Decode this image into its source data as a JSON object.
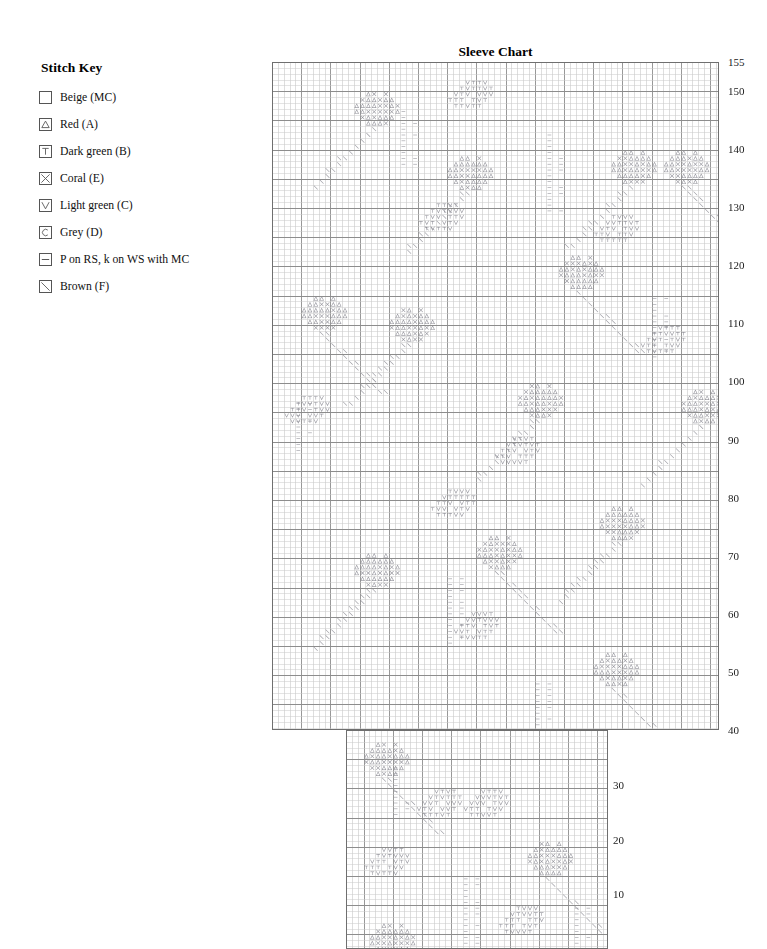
{
  "key": {
    "title": "Stitch Key",
    "items": [
      {
        "symbol": "empty-box",
        "icon": "blank-swatch-icon",
        "label": "Beige (MC)"
      },
      {
        "symbol": "triangle",
        "icon": "triangle-swatch-icon",
        "label": "Red (A)"
      },
      {
        "symbol": "t",
        "icon": "t-swatch-icon",
        "label": "Dark green (B)"
      },
      {
        "symbol": "x",
        "icon": "x-swatch-icon",
        "label": "Coral (E)"
      },
      {
        "symbol": "v",
        "icon": "v-swatch-icon",
        "label": "Light green (C)"
      },
      {
        "symbol": "c",
        "icon": "c-swatch-icon",
        "label": "Grey (D)"
      },
      {
        "symbol": "dash",
        "icon": "dash-swatch-icon",
        "label": "P on RS, k on WS with MC"
      },
      {
        "symbol": "diagonal",
        "icon": "diagonal-swatch-icon",
        "label": "Brown (F)"
      }
    ]
  },
  "chart": {
    "title": "Sleeve Chart",
    "row_labels": [
      "155",
      "150",
      "140",
      "130",
      "120",
      "110",
      "100",
      "90",
      "80",
      "70",
      "60",
      "50",
      "40",
      "30",
      "20",
      "10"
    ],
    "colors": {
      "grid_light": "#c9c9c9",
      "grid_bold": "#8d8d8d",
      "border": "#6f6f6f",
      "symbol": "#8e8e96",
      "text": "#1a1a1a"
    }
  },
  "chart_data": {
    "type": "heatmap",
    "title": "Sleeve Chart",
    "xlabel": "",
    "ylabel": "Row",
    "grid": true,
    "legend_position": "left",
    "cell_px": 5.84,
    "upper_section": {
      "rows": [
        40,
        155
      ],
      "stitches": 76,
      "x": 272,
      "y": 62,
      "width": 447,
      "height": 668
    },
    "lower_section": {
      "rows": [
        1,
        40
      ],
      "stitches": 45,
      "x": 346,
      "y": 730,
      "width": 262,
      "height": 219
    },
    "row_label_ticks": [
      155,
      150,
      140,
      130,
      120,
      110,
      100,
      90,
      80,
      70,
      60,
      50,
      40,
      30,
      20,
      10
    ],
    "symbols_used": [
      "triangle",
      "x",
      "t",
      "v",
      "c",
      "dash",
      "diagonal",
      "blank"
    ],
    "motifs": [
      {
        "type": "flower-head",
        "symbols": [
          "triangle",
          "x"
        ],
        "row": 150,
        "stitch": 14
      },
      {
        "type": "leaf-cluster",
        "symbols": [
          "t",
          "v"
        ],
        "row": 152,
        "stitch": 30
      },
      {
        "type": "flower-head",
        "symbols": [
          "triangle",
          "x"
        ],
        "row": 140,
        "stitch": 58
      },
      {
        "type": "flower-head",
        "symbols": [
          "triangle",
          "x"
        ],
        "row": 140,
        "stitch": 67
      },
      {
        "type": "flower-head",
        "symbols": [
          "triangle",
          "x"
        ],
        "row": 139,
        "stitch": 30
      },
      {
        "type": "leaf-cluster",
        "symbols": [
          "t",
          "v"
        ],
        "row": 131,
        "stitch": 25
      },
      {
        "type": "leaf-cluster",
        "symbols": [
          "t",
          "v"
        ],
        "row": 129,
        "stitch": 55
      },
      {
        "type": "flower-head",
        "symbols": [
          "triangle",
          "x"
        ],
        "row": 122,
        "stitch": 49
      },
      {
        "type": "flower-head",
        "symbols": [
          "triangle",
          "x"
        ],
        "row": 113,
        "stitch": 20
      },
      {
        "type": "flower-head",
        "symbols": [
          "triangle",
          "x"
        ],
        "row": 115,
        "stitch": 5
      },
      {
        "type": "leaf-cluster",
        "symbols": [
          "t",
          "v"
        ],
        "row": 110,
        "stitch": 63
      },
      {
        "type": "flower-head",
        "symbols": [
          "triangle",
          "x"
        ],
        "row": 100,
        "stitch": 42
      },
      {
        "type": "flower-head",
        "symbols": [
          "triangle",
          "x"
        ],
        "row": 99,
        "stitch": 70
      },
      {
        "type": "leaf-cluster",
        "symbols": [
          "t",
          "v"
        ],
        "row": 97,
        "stitch": 2
      },
      {
        "type": "leaf-cluster",
        "symbols": [
          "t",
          "v"
        ],
        "row": 90,
        "stitch": 38
      },
      {
        "type": "leaf-cluster",
        "symbols": [
          "t",
          "v"
        ],
        "row": 81,
        "stitch": 27
      },
      {
        "type": "flower-head",
        "symbols": [
          "triangle",
          "x"
        ],
        "row": 78,
        "stitch": 56
      },
      {
        "type": "flower-head",
        "symbols": [
          "triangle",
          "x"
        ],
        "row": 73,
        "stitch": 35
      },
      {
        "type": "flower-head",
        "symbols": [
          "triangle",
          "x"
        ],
        "row": 70,
        "stitch": 14
      },
      {
        "type": "leaf-cluster",
        "symbols": [
          "t",
          "v"
        ],
        "row": 60,
        "stitch": 31
      },
      {
        "type": "flower-head",
        "symbols": [
          "triangle",
          "x"
        ],
        "row": 53,
        "stitch": 55
      },
      {
        "type": "purl-column",
        "symbols": [
          "dash"
        ],
        "row": 48,
        "stitch": 45
      },
      {
        "type": "flower-head",
        "symbols": [
          "triangle",
          "x"
        ],
        "row": 38,
        "stitch": 9
      },
      {
        "type": "leaf-cluster",
        "symbols": [
          "t",
          "v"
        ],
        "row": 30,
        "stitch": 18
      },
      {
        "type": "leaf-cluster",
        "symbols": [
          "t",
          "v"
        ],
        "row": 29,
        "stitch": 26
      },
      {
        "type": "flower-head",
        "symbols": [
          "triangle",
          "x"
        ],
        "row": 20,
        "stitch": 37
      },
      {
        "type": "leaf-cluster",
        "symbols": [
          "t",
          "v"
        ],
        "row": 19,
        "stitch": 9
      },
      {
        "type": "flower-head",
        "symbols": [
          "triangle",
          "x"
        ],
        "row": 5,
        "stitch": 10
      },
      {
        "type": "leaf-cluster",
        "symbols": [
          "t",
          "v"
        ],
        "row": 8,
        "stitch": 32
      }
    ]
  }
}
